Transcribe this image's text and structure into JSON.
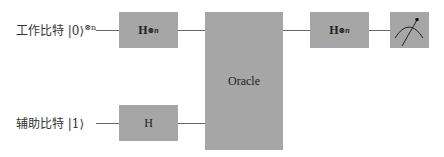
{
  "qubits": [
    {
      "label": "工作比特 |0⟩",
      "superscript": "⊗n"
    },
    {
      "label": "辅助比特 |1⟩",
      "superscript": ""
    }
  ],
  "gates": {
    "h_n_first": {
      "label": "H",
      "superscript": "⊗n"
    },
    "h_single": {
      "label": "H"
    },
    "oracle": {
      "label": "Oracle"
    },
    "h_n_second": {
      "label": "H",
      "superscript": "⊗n"
    },
    "measure": {
      "icon": "meter-icon"
    }
  },
  "colors": {
    "gate_fill": "#a6a6a6",
    "wire": "#666666"
  }
}
